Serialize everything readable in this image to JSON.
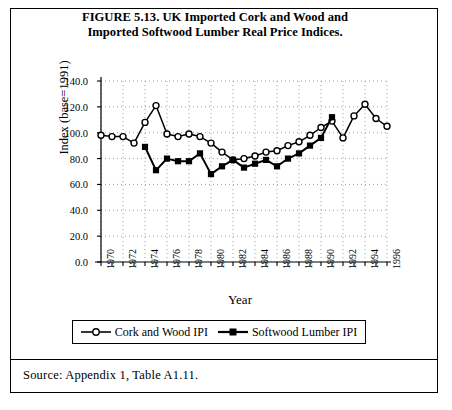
{
  "figure": {
    "title_line1": "FIGURE 5.13.  UK Imported Cork and Wood and",
    "title_line2": "Imported Softwood Lumber Real Price Indices.",
    "source": "Source:  Appendix 1, Table A1.11."
  },
  "legend": {
    "items": [
      {
        "label": "Cork and Wood IPI",
        "marker": "open-circle"
      },
      {
        "label": "Softwood Lumber IPI",
        "marker": "filled-square"
      }
    ]
  },
  "chart_data": {
    "type": "line",
    "title": "FIGURE 5.13.  UK Imported Cork and Wood and Imported Softwood Lumber Real Price Indices.",
    "xlabel": "Year",
    "ylabel": "Index (base=1991)",
    "xlim": [
      1970,
      1996
    ],
    "ylim": [
      0.0,
      140.0
    ],
    "ytick_labels": [
      "140.0",
      "120.0",
      "100.0",
      "80.0",
      "60.0",
      "40.0",
      "20.0",
      "0.0"
    ],
    "ytick_values": [
      140.0,
      120.0,
      100.0,
      80.0,
      60.0,
      40.0,
      20.0,
      0.0
    ],
    "xtick_labels": [
      "1970",
      "1972",
      "1974",
      "1976",
      "1978",
      "1980",
      "1982",
      "1984",
      "1986",
      "1988",
      "1990",
      "1992",
      "1994",
      "1996"
    ],
    "xtick_values": [
      1970,
      1972,
      1974,
      1976,
      1978,
      1980,
      1982,
      1984,
      1986,
      1988,
      1990,
      1992,
      1994,
      1996
    ],
    "minor_xticks_every": 1,
    "grid": true,
    "legend_position": "below-axes",
    "x": [
      1970,
      1971,
      1972,
      1973,
      1974,
      1975,
      1976,
      1977,
      1978,
      1979,
      1980,
      1981,
      1982,
      1983,
      1984,
      1985,
      1986,
      1987,
      1988,
      1989,
      1990,
      1991,
      1992,
      1993,
      1994,
      1995,
      1996
    ],
    "series": [
      {
        "name": "Cork and Wood IPI",
        "marker": "open-circle",
        "values": [
          98,
          97,
          97,
          92,
          108,
          121,
          99,
          97,
          99,
          97,
          92,
          85,
          79,
          80,
          82,
          85,
          86,
          90,
          93,
          98,
          104,
          109,
          96,
          113,
          122,
          111,
          105
        ]
      },
      {
        "name": "Softwood Lumber IPI",
        "marker": "filled-square",
        "start_year": 1974,
        "end_year": 1991,
        "values": [
          null,
          null,
          null,
          null,
          89,
          71,
          80,
          78,
          78,
          84,
          68,
          74,
          79,
          73,
          76,
          79,
          74,
          80,
          84,
          90,
          96,
          112,
          null,
          null,
          null,
          null,
          null
        ]
      }
    ]
  }
}
